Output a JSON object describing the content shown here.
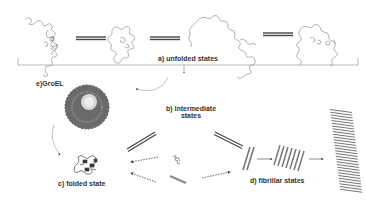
{
  "diagram": {
    "labels": {
      "unfolded": "a) unfolded states",
      "intermediate_line1": "b) intermediate",
      "intermediate_line2": "states",
      "folded": "c) folded state",
      "fibrillar": "d) fibrillar states",
      "groel": "e)GroEL"
    },
    "colors": {
      "line": "#555555",
      "text": "#333333",
      "chaperone": "#6a6a6a",
      "fibril": "#777777",
      "background": "#ffffff"
    },
    "nodes": [
      {
        "id": "unfolded-1",
        "type": "random-coil"
      },
      {
        "id": "unfolded-2",
        "type": "random-coil"
      },
      {
        "id": "unfolded-3",
        "type": "random-coil"
      },
      {
        "id": "unfolded-4",
        "type": "random-coil"
      },
      {
        "id": "groel",
        "type": "chaperone-ring"
      },
      {
        "id": "folded",
        "type": "folded-protein"
      },
      {
        "id": "intermediate-small",
        "type": "small-aggregate"
      },
      {
        "id": "intermediate-rod",
        "type": "rod"
      },
      {
        "id": "protofibril",
        "type": "fibril-pair"
      },
      {
        "id": "fibril-bundle",
        "type": "fibril-bundle"
      },
      {
        "id": "mature-fibril",
        "type": "mature-fibril"
      }
    ],
    "edges": [
      {
        "from": "unfolded-1",
        "to": "unfolded-2",
        "style": "equilibrium"
      },
      {
        "from": "unfolded-2",
        "to": "unfolded-3",
        "style": "equilibrium"
      },
      {
        "from": "unfolded-3",
        "to": "unfolded-4",
        "style": "equilibrium"
      },
      {
        "from": "unfolded-states",
        "to": "intermediate-states",
        "style": "arrow"
      },
      {
        "from": "intermediate-states",
        "to": "groel",
        "style": "curved-arrow"
      },
      {
        "from": "groel",
        "to": "folded",
        "style": "curved-arrow"
      },
      {
        "from": "folded",
        "to": "intermediate-states",
        "style": "equilibrium"
      },
      {
        "from": "intermediate-states",
        "to": "protofibril",
        "style": "equilibrium"
      },
      {
        "from": "intermediate-small",
        "to": "folded",
        "style": "dotted-arrow"
      },
      {
        "from": "intermediate-rod",
        "to": "folded",
        "style": "dotted-arrow"
      },
      {
        "from": "intermediate-rod",
        "to": "protofibril",
        "style": "dotted-arrow"
      },
      {
        "from": "protofibril",
        "to": "fibril-bundle",
        "style": "arrow"
      },
      {
        "from": "fibril-bundle",
        "to": "mature-fibril",
        "style": "arrow"
      }
    ]
  }
}
